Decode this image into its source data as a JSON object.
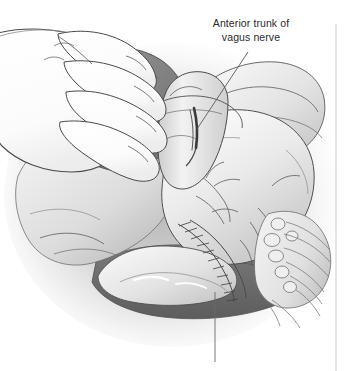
{
  "figure": {
    "type": "medical-illustration",
    "style": "grayscale line-and-wash anatomical drawing",
    "background_color": "#ffffff",
    "width": 357,
    "height": 371
  },
  "annotations": {
    "vagus_label": {
      "line1": "Anterior trunk of",
      "line2": "vagus nerve",
      "text_color": "#2b2b2b",
      "leader": {
        "from_x": 248,
        "from_y": 52,
        "to_x": 197,
        "to_y": 129,
        "color": "#5a5a5a"
      }
    },
    "lower_leader": {
      "from_x": 215,
      "from_y": 292,
      "to_x": 215,
      "to_y": 362,
      "color": "#6a6a6a"
    },
    "right_rule": {
      "x": 336,
      "from_y": 24,
      "to_y": 371,
      "color": "#c9c9c9"
    }
  },
  "palette": {
    "outline": "#4a4a4a",
    "outline_soft": "#6f6f6f",
    "tissue_light": "#f2f2f2",
    "tissue_mid": "#d8d8d8",
    "tissue_shadow": "#b0b0b0",
    "cavity_dark": "#6d6d6d",
    "cavity_darker": "#5a5a5a",
    "hand_fill": "#fdfdfd",
    "vignette": "#bdbdbd"
  },
  "structures": [
    {
      "name": "surgeon-hand",
      "description": "Gloved hand with four fingers retracting the left lobe of the liver, upper left"
    },
    {
      "name": "liver-lobe",
      "description": "Dark retracted lobe beneath the fingers"
    },
    {
      "name": "esophagus",
      "description": "Pale vertical tubular structure at center, encircled at the hiatus"
    },
    {
      "name": "vagus-nerve-anterior-trunk",
      "description": "Dark narrow strand lying on the anterior esophagus"
    },
    {
      "name": "stomach-fundus",
      "description": "Large pale rounded mass, right of center"
    },
    {
      "name": "gastric-vessels",
      "description": "Branching vessel and nerve twigs over the stomach wall"
    },
    {
      "name": "ribbed-band",
      "description": "Curved striated/sutured band along the lower stomach curvature"
    },
    {
      "name": "omentum-fan",
      "description": "Fan of fat lobules and vessels at lower right"
    },
    {
      "name": "retracted-cavity",
      "description": "Dark open space below the stomach"
    }
  ]
}
